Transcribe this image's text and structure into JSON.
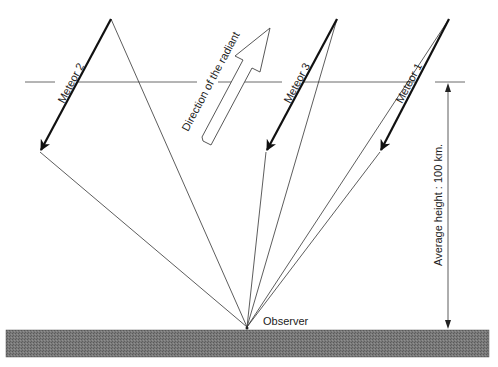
{
  "diagram": {
    "title": "",
    "labels": {
      "meteor_1": "Meteor 1",
      "meteor_2": "Meteor 2",
      "meteor_3": "Meteor 3",
      "radiant": "Direction of the radiant",
      "height": "Average height : 100 km.",
      "observer": "Observer"
    },
    "colors": {
      "line": "#333333",
      "meteor": "#111111",
      "ground": "#6e6e6e",
      "background": "#ffffff"
    },
    "geometry": {
      "observer": [
        247,
        327
      ],
      "reference_height_y": 82,
      "ground": {
        "x": 6,
        "y": 330,
        "width": 483,
        "height": 27
      },
      "meteors": [
        {
          "name": "Meteor 2",
          "start": [
            111,
            19
          ],
          "end": [
            40,
            152
          ]
        },
        {
          "name": "Meteor 3",
          "start": [
            337,
            19
          ],
          "end": [
            266,
            152
          ]
        },
        {
          "name": "Meteor 1",
          "start": [
            449,
            19
          ],
          "end": [
            380,
            152
          ]
        }
      ]
    }
  }
}
